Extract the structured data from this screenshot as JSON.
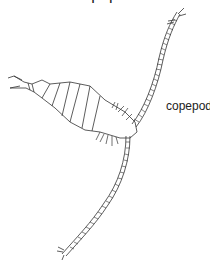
{
  "title": "copepod",
  "label": "copepod",
  "colors": {
    "line": "#333333",
    "background": "#ffffff"
  }
}
